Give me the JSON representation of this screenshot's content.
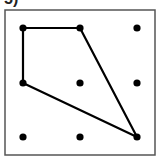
{
  "label": "5)",
  "frame": {
    "x": 5,
    "y": 10,
    "width": 150,
    "height": 145,
    "stroke": "#555555"
  },
  "grid": {
    "columns_x": [
      23,
      80,
      137
    ],
    "rows_y": [
      28,
      83,
      137
    ],
    "dot_radius": 3.6,
    "dot_color": "#000000"
  },
  "shape": {
    "type": "quadrilateral",
    "vertices": [
      {
        "col": 0,
        "row": 0
      },
      {
        "col": 1,
        "row": 0
      },
      {
        "col": 2,
        "row": 2
      },
      {
        "col": 0,
        "row": 1
      }
    ],
    "stroke": "#000000",
    "stroke_width": 2.2
  }
}
